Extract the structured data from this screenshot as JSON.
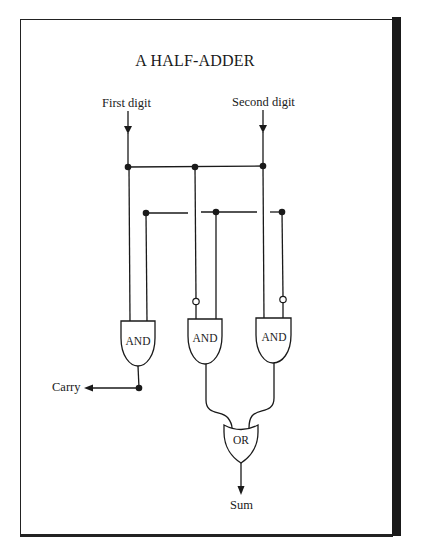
{
  "diagram": {
    "title": "A HALF-ADDER",
    "inputs": [
      {
        "id": "a",
        "label": "First digit"
      },
      {
        "id": "b",
        "label": "Second digit"
      }
    ],
    "gates": [
      {
        "id": "and1",
        "type": "AND",
        "label": "AND",
        "inputs": [
          "First digit",
          "Second digit"
        ],
        "output": "Carry"
      },
      {
        "id": "and2",
        "type": "AND",
        "label": "AND",
        "inputs": [
          "NOT First digit",
          "Second digit"
        ],
        "output": "or1"
      },
      {
        "id": "and3",
        "type": "AND",
        "label": "AND",
        "inputs": [
          "First digit",
          "NOT Second digit"
        ],
        "output": "or1"
      },
      {
        "id": "or1",
        "type": "OR",
        "label": "OR",
        "inputs": [
          "and2",
          "and3"
        ],
        "output": "Sum"
      }
    ],
    "outputs": [
      {
        "id": "carry",
        "label": "Carry"
      },
      {
        "id": "sum",
        "label": "Sum"
      }
    ],
    "colors": {
      "ink": "#1a1a1a",
      "background": "#ffffff"
    }
  }
}
